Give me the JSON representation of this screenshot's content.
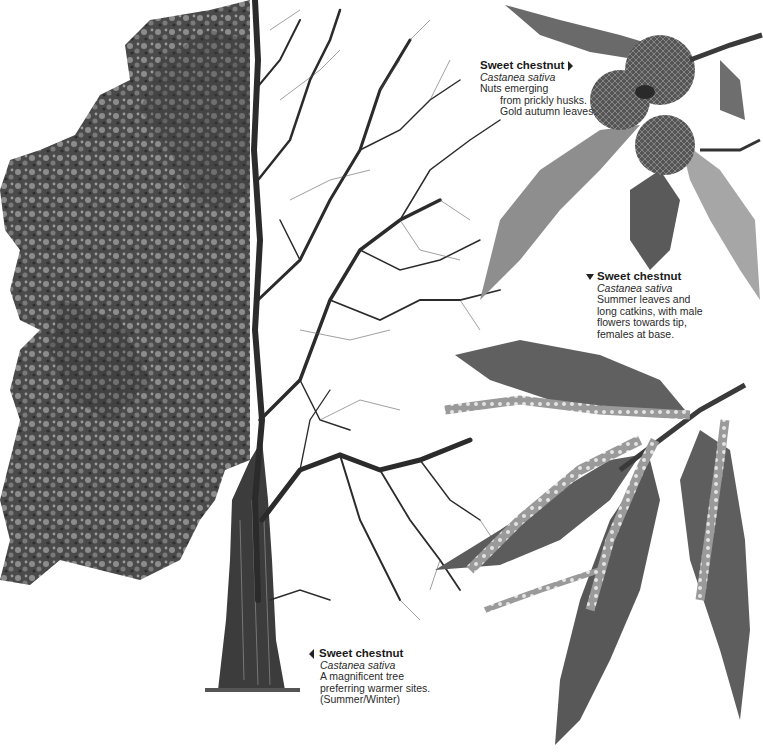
{
  "illustration": {
    "subject": "Sweet chestnut tree, half summer foliage / half winter bare branches, with leaf and nut details",
    "colors": {
      "foliage_dark": "#3a3a3a",
      "foliage_light": "#8a8a8a",
      "trunk": "#3c3c3c",
      "branch": "#2b2b2b",
      "leaf": "#5a5a5a",
      "background": "#ffffff"
    }
  },
  "captions": {
    "autumn": {
      "title": "Sweet chestnut",
      "pointer": "right",
      "latin": "Castanea sativa",
      "lines": [
        "Nuts emerging",
        "from prickly husks.",
        "Gold autumn leaves."
      ]
    },
    "summer": {
      "title": "Sweet chestnut",
      "pointer": "down",
      "latin": "Castanea sativa",
      "lines": [
        "Summer leaves and",
        "long catkins, with male",
        "flowers towards tip,",
        "females at base."
      ]
    },
    "tree": {
      "title": "Sweet chestnut",
      "pointer": "left",
      "latin": "Castanea sativa",
      "lines": [
        "A magnificent tree",
        "preferring warmer sites.",
        "(Summer/Winter)"
      ]
    }
  }
}
